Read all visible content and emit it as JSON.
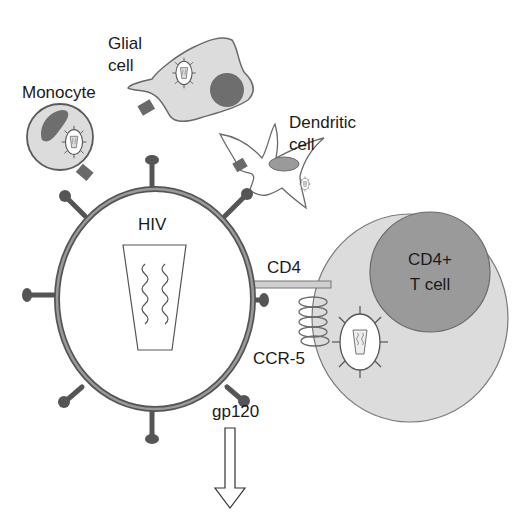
{
  "diagram": {
    "labels": {
      "glial_line1": "Glial",
      "glial_line2": "cell",
      "monocyte": "Monocyte",
      "dendritic_line1": "Dendritic",
      "dendritic_line2": "cell",
      "hiv": "HIV",
      "cd4": "CD4",
      "tcell_line1": "CD4+",
      "tcell_line2": "T cell",
      "ccr5": "CCR-5",
      "gp120": "gp120"
    },
    "colors": {
      "cell_fill": "#dcdcdc",
      "nucleus_fill": "#6e6e6e",
      "tcell_nucleus_fill": "#9a9a9a",
      "membrane": "#5a5a5a",
      "spike": "#555555",
      "receptor": "#6a6a6a",
      "cd4_fill": "#cfcfcf",
      "background": "#ffffff"
    },
    "nodes": [
      {
        "id": "hiv",
        "label": "HIV"
      },
      {
        "id": "cd4-t-cell",
        "label": "CD4+ T cell"
      },
      {
        "id": "monocyte",
        "label": "Monocyte"
      },
      {
        "id": "glial-cell",
        "label": "Glial cell"
      },
      {
        "id": "dendritic-cell",
        "label": "Dendritic cell"
      }
    ],
    "edges": [
      {
        "from": "hiv",
        "to": "cd4-t-cell",
        "via": "CD4"
      },
      {
        "from": "hiv",
        "to": "cd4-t-cell",
        "via": "CCR-5"
      }
    ]
  }
}
